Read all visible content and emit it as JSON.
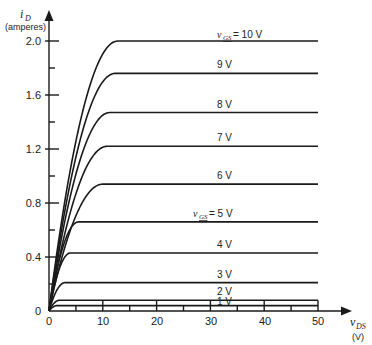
{
  "chart_data": {
    "type": "line",
    "title": "",
    "xlabel": "v_DS (V)",
    "ylabel": "i_D (amperes)",
    "xlim": [
      0,
      50
    ],
    "ylim": [
      0,
      2.0
    ],
    "x_ticks": [
      0,
      10,
      20,
      30,
      40,
      50
    ],
    "x_minor_ticks": [
      5,
      15,
      25,
      35,
      45
    ],
    "y_ticks": [
      0,
      0.4,
      0.8,
      1.2,
      1.6,
      2.0
    ],
    "y_tick_labels": [
      "0",
      "0.4",
      "0.8",
      "1.2",
      "1.6",
      "2.0"
    ],
    "y_minor_ticks": [
      0.2,
      0.6,
      1.0,
      1.4,
      1.8
    ],
    "grid": false,
    "legend": "inline labels on curves",
    "series": [
      {
        "name": "v_GS = 10 V",
        "label": "10 V",
        "saturation_current": 2.0,
        "knee_vds": 12.8
      },
      {
        "name": "v_GS = 9 V",
        "label": "9 V",
        "saturation_current": 1.76,
        "knee_vds": 12.3
      },
      {
        "name": "v_GS = 8 V",
        "label": "8 V",
        "saturation_current": 1.47,
        "knee_vds": 11.3
      },
      {
        "name": "v_GS = 7 V",
        "label": "7 V",
        "saturation_current": 1.22,
        "knee_vds": 10.8
      },
      {
        "name": "v_GS = 6 V",
        "label": "6 V",
        "saturation_current": 0.94,
        "knee_vds": 10.0
      },
      {
        "name": "v_GS = 5 V",
        "label": "5 V",
        "saturation_current": 0.66,
        "knee_vds": 5.5
      },
      {
        "name": "v_GS = 4 V",
        "label": "4 V",
        "saturation_current": 0.43,
        "knee_vds": 4.0
      },
      {
        "name": "v_GS = 3 V",
        "label": "3 V",
        "saturation_current": 0.21,
        "knee_vds": 3.0
      },
      {
        "name": "v_GS = 2 V",
        "label": "2 V",
        "saturation_current": 0.08,
        "knee_vds": 2.0
      },
      {
        "name": "v_GS = 1 V",
        "label": "1 V",
        "saturation_current": 0.04,
        "knee_vds": 1.5
      }
    ],
    "annotations": [
      "v_GS = 10 V",
      "v_GS = 5 V"
    ]
  },
  "labels": {
    "y_axis_symbol": "i",
    "y_axis_sub": "D",
    "y_axis_unit": "(amperes)",
    "x_axis_symbol": "v",
    "x_axis_sub": "DS",
    "x_axis_unit": "(V)",
    "vgs_symbol": "v",
    "vgs_sub": "GS",
    "curve_10": "= 10 V",
    "curve_9": "9 V",
    "curve_8": "8 V",
    "curve_7": "7 V",
    "curve_6": "6 V",
    "curve_5": "= 5 V",
    "curve_4": "4 V",
    "curve_3": "3 V",
    "curve_2": "2 V",
    "curve_1": "1 V",
    "x0": "0",
    "x10": "10",
    "x20": "20",
    "x30": "30",
    "x40": "40",
    "x50": "50",
    "y0": "0",
    "y04": "0.4",
    "y08": "0.8",
    "y12": "1.2",
    "y16": "1.6",
    "y20": "2.0"
  }
}
